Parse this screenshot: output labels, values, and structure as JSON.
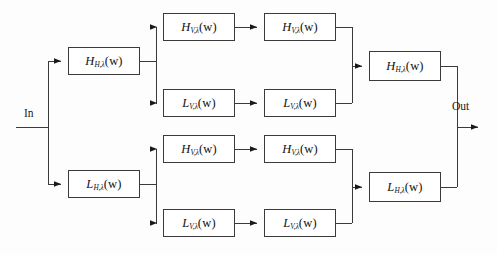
{
  "figure": {
    "type": "block-diagram",
    "title": "",
    "background_color": "#fdfdfd",
    "line_color": "#3a3a3a",
    "text_color": "#111111"
  },
  "io": {
    "input_label": "In",
    "output_label": "Out"
  },
  "nodes": [
    {
      "id": "h-h-lambda",
      "head": "H",
      "tilde": "",
      "subscript": "H,λ",
      "arg": "(w)",
      "text": "H_{H,λ}(w)",
      "x": 68,
      "y": 47,
      "w": 72,
      "h": 28
    },
    {
      "id": "r1-h-v-lambda",
      "head": "H",
      "tilde": "",
      "subscript": "V,λ",
      "arg": "(w)",
      "text": "H_{V,λ}(w)",
      "x": 163,
      "y": 13,
      "w": 72,
      "h": 28
    },
    {
      "id": "r1-h-v-lambda-tilde",
      "head": "H",
      "tilde": "~",
      "subscript": "V,λ",
      "arg": "(w)",
      "text": "Ĥ_{V,λ}(w)",
      "x": 264,
      "y": 13,
      "w": 72,
      "h": 28
    },
    {
      "id": "r2-l-v-lambda",
      "head": "L",
      "tilde": "",
      "subscript": "V,λ",
      "arg": "(w)",
      "text": "L_{V,λ}(w)",
      "x": 163,
      "y": 89,
      "w": 72,
      "h": 28
    },
    {
      "id": "r2-l-v-lambda-tilde",
      "head": "L",
      "tilde": "~",
      "subscript": "V,λ",
      "arg": "(w)",
      "text": "L̃_{V,λ}(w)",
      "x": 264,
      "y": 89,
      "w": 72,
      "h": 28
    },
    {
      "id": "l-h-lambda",
      "head": "L",
      "tilde": "",
      "subscript": "H,λ",
      "arg": "(w)",
      "text": "L_{H,λ}(w)",
      "x": 68,
      "y": 170,
      "w": 72,
      "h": 28
    },
    {
      "id": "r3-h-v-lambda",
      "head": "H",
      "tilde": "",
      "subscript": "V,λ",
      "arg": "(w)",
      "text": "H_{V,λ}(w)",
      "x": 163,
      "y": 135,
      "w": 72,
      "h": 28
    },
    {
      "id": "r3-h-v-lambda-tilde",
      "head": "H",
      "tilde": "~",
      "subscript": "V,λ",
      "arg": "(w)",
      "text": "Ĥ_{V,λ}(w)",
      "x": 264,
      "y": 135,
      "w": 72,
      "h": 28
    },
    {
      "id": "r4-l-v-lambda",
      "head": "L",
      "tilde": "",
      "subscript": "V,λ",
      "arg": "(w)",
      "text": "L_{V,λ}(w)",
      "x": 163,
      "y": 209,
      "w": 72,
      "h": 28
    },
    {
      "id": "r4-l-v-lambda-tilde",
      "head": "L",
      "tilde": "~",
      "subscript": "V,λ",
      "arg": "(w)",
      "text": "L̃_{V,λ}(w)",
      "x": 264,
      "y": 209,
      "w": 72,
      "h": 28
    },
    {
      "id": "out-h-h-lambda-tilde",
      "head": "H",
      "tilde": "~",
      "subscript": "H,λ",
      "arg": "(w)",
      "text": "Ĥ_{H,λ}(w)",
      "x": 369,
      "y": 51,
      "w": 72,
      "h": 30
    },
    {
      "id": "out-l-h-lambda-tilde",
      "head": "L",
      "tilde": "~",
      "subscript": "H,λ",
      "arg": "(w)",
      "text": "L̃_{H,λ}(w)",
      "x": 369,
      "y": 172,
      "w": 72,
      "h": 30
    }
  ]
}
